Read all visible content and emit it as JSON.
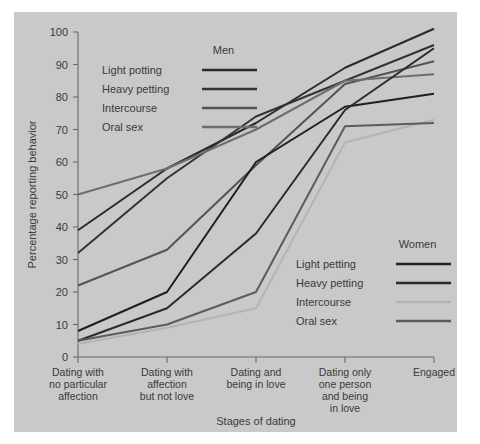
{
  "chart_data": {
    "type": "line",
    "title": "",
    "xlabel": "Stages of dating",
    "ylabel": "Percentage reporting behavior",
    "ylim": [
      0,
      100
    ],
    "yticks": [
      0,
      10,
      20,
      30,
      40,
      50,
      60,
      70,
      80,
      90,
      100
    ],
    "grid": false,
    "categories": [
      "Dating with no particular affection",
      "Dating with affection but not love",
      "Dating and being in love",
      "Dating only one person and being in love",
      "Engaged"
    ],
    "category_lines": [
      [
        "Dating with",
        "no particular",
        "affection"
      ],
      [
        "Dating with",
        "affection",
        "but not love"
      ],
      [
        "Dating and",
        "being in love"
      ],
      [
        "Dating only",
        "one person",
        "and being",
        "in love"
      ],
      [
        "Engaged"
      ]
    ],
    "legend_position": "inside: Men top-left, Women bottom-right",
    "groups": [
      {
        "name": "Men",
        "series": [
          {
            "name": "Light petting",
            "color": "#2b2b2b",
            "values": [
              39,
              58,
              72,
              89,
              101
            ]
          },
          {
            "name": "Heavy petting",
            "color": "#333333",
            "values": [
              32,
              55,
              74,
              85,
              96
            ]
          },
          {
            "name": "Intercourse",
            "color": "#545454",
            "values": [
              22,
              33,
              59,
              84,
              91
            ]
          },
          {
            "name": "Oral sex",
            "color": "#6e6e6e",
            "values": [
              50,
              58,
              70,
              85,
              87
            ]
          }
        ]
      },
      {
        "name": "Women",
        "series": [
          {
            "name": "Light petting",
            "color": "#1f1f1f",
            "values": [
              8,
              20,
              60,
              77,
              81
            ]
          },
          {
            "name": "Heavy petting",
            "color": "#2b2b2b",
            "values": [
              5,
              15,
              38,
              76,
              95
            ]
          },
          {
            "name": "Intercourse",
            "color": "#b4b4b4",
            "values": [
              4,
              9,
              15,
              66,
              73
            ]
          },
          {
            "name": "Oral sex",
            "color": "#5c5c5c",
            "values": [
              5,
              10,
              20,
              71,
              72
            ]
          }
        ]
      }
    ]
  },
  "legend": {
    "men": {
      "title": "Men",
      "items": [
        {
          "label": "Light potting"
        },
        {
          "label": "Heavy petting"
        },
        {
          "label": "Intercourse"
        },
        {
          "label": "Oral sex"
        }
      ]
    },
    "women": {
      "title": "Women",
      "items": [
        {
          "label": "Light petting"
        },
        {
          "label": "Heavy petting"
        },
        {
          "label": "Intercourse"
        },
        {
          "label": "Oral sex"
        }
      ]
    }
  },
  "colors": {
    "figure_background": "#c9c9c9",
    "page_background": "#ffffff",
    "axis": "#6a6a6a",
    "text": "#3a3a3a"
  }
}
